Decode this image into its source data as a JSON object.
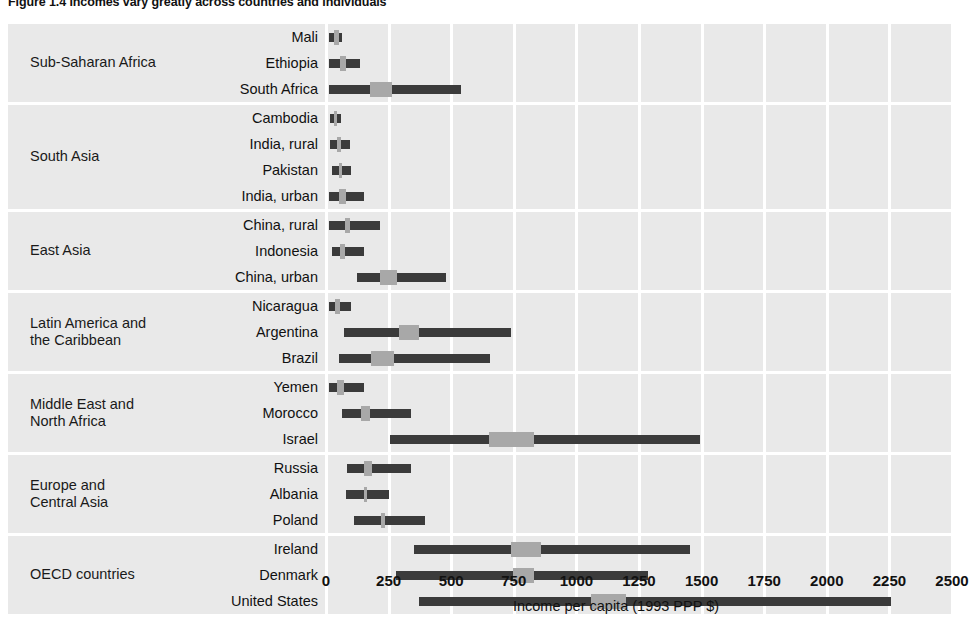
{
  "figure": {
    "title": "Figure 1.4  Incomes vary greatly across countries and individuals",
    "axis_title": "Income per capita (1993 PPP $)"
  },
  "axis": {
    "ticks": [
      "0",
      "250",
      "500",
      "750",
      "1000",
      "1250",
      "1500",
      "1750",
      "2000",
      "2250",
      "2500"
    ],
    "min": 0,
    "max": 2500,
    "step": 250
  },
  "groups": [
    {
      "label": "Sub-Saharan Africa",
      "rows": [
        "Mali",
        "Ethiopia",
        "South Africa"
      ]
    },
    {
      "label": "South Asia",
      "rows": [
        "Cambodia",
        "India, rural",
        "Pakistan",
        "India, urban"
      ]
    },
    {
      "label": "East Asia",
      "rows": [
        "China, rural",
        "Indonesia",
        "China, urban"
      ]
    },
    {
      "label": "Latin America and\nthe Caribbean",
      "rows": [
        "Nicaragua",
        "Argentina",
        "Brazil"
      ]
    },
    {
      "label": "Middle East and\nNorth Africa",
      "rows": [
        "Yemen",
        "Morocco",
        "Israel"
      ]
    },
    {
      "label": "Europe and\nCentral Asia",
      "rows": [
        "Russia",
        "Albania",
        "Poland"
      ]
    },
    {
      "label": "OECD countries",
      "rows": [
        "Ireland",
        "Denmark",
        "United States"
      ]
    }
  ],
  "chart_data": {
    "type": "bar",
    "title": "Figure 1.4  Incomes vary greatly across countries and individuals",
    "xlabel": "Income per capita (1993 PPP $)",
    "ylabel": "",
    "xlim": [
      0,
      2500
    ],
    "grid": true,
    "legend": null,
    "categories": [
      "Mali",
      "Ethiopia",
      "South Africa",
      "Cambodia",
      "India, rural",
      "Pakistan",
      "India, urban",
      "China, rural",
      "Indonesia",
      "China, urban",
      "Nicaragua",
      "Argentina",
      "Brazil",
      "Yemen",
      "Morocco",
      "Israel",
      "Russia",
      "Albania",
      "Poland",
      "Ireland",
      "Denmark",
      "United States"
    ],
    "series": [
      {
        "name": "income range (low, median-band-start, median-band-end, high)",
        "values": [
          {
            "category": "Mali",
            "low": 10,
            "median_start": 30,
            "median_end": 50,
            "high": 65
          },
          {
            "category": "Ethiopia",
            "low": 10,
            "median_start": 55,
            "median_end": 80,
            "high": 135
          },
          {
            "category": "South Africa",
            "low": 10,
            "median_start": 175,
            "median_end": 265,
            "high": 540
          },
          {
            "category": "Cambodia",
            "low": 15,
            "median_start": 30,
            "median_end": 45,
            "high": 60
          },
          {
            "category": "India, rural",
            "low": 15,
            "median_start": 45,
            "median_end": 60,
            "high": 95
          },
          {
            "category": "Pakistan",
            "low": 25,
            "median_start": 50,
            "median_end": 65,
            "high": 100
          },
          {
            "category": "India, urban",
            "low": 10,
            "median_start": 50,
            "median_end": 80,
            "high": 150
          },
          {
            "category": "China, rural",
            "low": 10,
            "median_start": 75,
            "median_end": 95,
            "high": 215
          },
          {
            "category": "Indonesia",
            "low": 25,
            "median_start": 55,
            "median_end": 75,
            "high": 150
          },
          {
            "category": "China, urban",
            "low": 125,
            "median_start": 215,
            "median_end": 285,
            "high": 480
          },
          {
            "category": "Nicaragua",
            "low": 10,
            "median_start": 35,
            "median_end": 55,
            "high": 100
          },
          {
            "category": "Argentina",
            "low": 70,
            "median_start": 290,
            "median_end": 370,
            "high": 740
          },
          {
            "category": "Brazil",
            "low": 50,
            "median_start": 180,
            "median_end": 270,
            "high": 655
          },
          {
            "category": "Yemen",
            "low": 10,
            "median_start": 45,
            "median_end": 70,
            "high": 150
          },
          {
            "category": "Morocco",
            "low": 65,
            "median_start": 140,
            "median_end": 175,
            "high": 340
          },
          {
            "category": "Israel",
            "low": 255,
            "median_start": 650,
            "median_end": 830,
            "high": 1495
          },
          {
            "category": "Russia",
            "low": 85,
            "median_start": 150,
            "median_end": 185,
            "high": 340
          },
          {
            "category": "Albania",
            "low": 80,
            "median_start": 150,
            "median_end": 165,
            "high": 250
          },
          {
            "category": "Poland",
            "low": 110,
            "median_start": 220,
            "median_end": 235,
            "high": 395
          },
          {
            "category": "Ireland",
            "low": 350,
            "median_start": 740,
            "median_end": 860,
            "high": 1455
          },
          {
            "category": "Denmark",
            "low": 280,
            "median_start": 745,
            "median_end": 830,
            "high": 1285
          },
          {
            "category": "United States",
            "low": 370,
            "median_start": 1060,
            "median_end": 1200,
            "high": 2255
          }
        ]
      }
    ]
  },
  "colors": {
    "band_background": "#e9e9e9",
    "bar": "#3b3b3b",
    "median_block": "#a8a8a8",
    "gridline": "#ffffff",
    "text": "#111111"
  }
}
